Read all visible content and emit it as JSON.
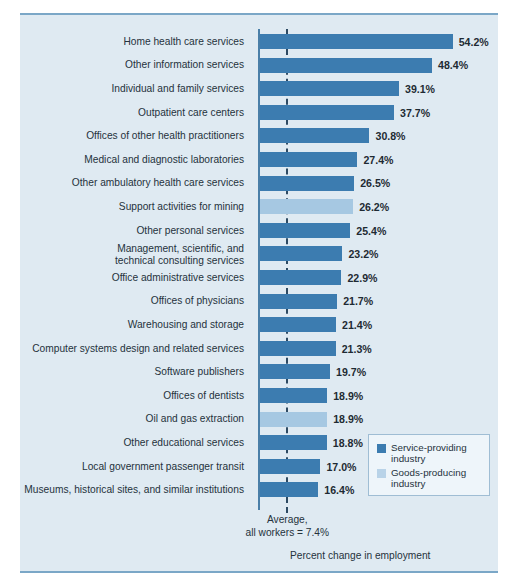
{
  "chart_data": {
    "type": "bar",
    "orientation": "horizontal",
    "title": "",
    "xlabel": "Percent change in employment",
    "ylabel": "",
    "xlim": [
      0,
      58
    ],
    "grid": false,
    "reference_line": {
      "value": 7.4,
      "label": "Average,\nall workers = 7.4%",
      "style": "dashed"
    },
    "legend": {
      "position": "bottom-right",
      "entries": [
        {
          "label": "Service-providing\nindustry",
          "color": "#3c7cb0",
          "key": "service"
        },
        {
          "label": "Goods-producing\nindustry",
          "color": "#b9d3e8",
          "key": "goods"
        }
      ]
    },
    "categories": [
      "Home health care services",
      "Other information services",
      "Individual and family services",
      "Outpatient care centers",
      "Offices of other health practitioners",
      "Medical and diagnostic laboratories",
      "Other ambulatory health care services",
      "Support activities for mining",
      "Other personal services",
      "Management, scientific, and\ntechnical consulting services",
      "Office administrative services",
      "Offices of physicians",
      "Warehousing and storage",
      "Computer systems design and related services",
      "Software publishers",
      "Offices of dentists",
      "Oil and gas extraction",
      "Other educational services",
      "Local government passenger transit",
      "Museums, historical sites, and similar institutions"
    ],
    "values": [
      54.2,
      48.4,
      39.1,
      37.7,
      30.8,
      27.4,
      26.5,
      26.2,
      25.4,
      23.2,
      22.9,
      21.7,
      21.4,
      21.3,
      19.7,
      18.9,
      18.9,
      18.8,
      17.0,
      16.4
    ],
    "value_labels": [
      "54.2%",
      "48.4%",
      "39.1%",
      "37.7%",
      "30.8%",
      "27.4%",
      "26.5%",
      "26.2%",
      "25.4%",
      "23.2%",
      "22.9%",
      "21.7%",
      "21.4%",
      "21.3%",
      "19.7%",
      "18.9%",
      "18.9%",
      "18.8%",
      "17.0%",
      "16.4%"
    ],
    "series_key": [
      "service",
      "service",
      "service",
      "service",
      "service",
      "service",
      "service",
      "goods",
      "service",
      "service",
      "service",
      "service",
      "service",
      "service",
      "service",
      "service",
      "goods",
      "service",
      "service",
      "service"
    ]
  },
  "colors": {
    "service": "#3c7cb0",
    "goods": "#a6c8e2",
    "goods_legend": "#b9d3e8",
    "panel": "#dfeaf2",
    "rule": "#7ba7c7",
    "axis": "#4a7fa8",
    "average_line": "#2d4a63",
    "text": "#25323c"
  }
}
